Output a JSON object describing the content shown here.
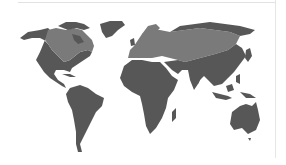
{
  "map": {
    "title": "World map",
    "projection": "equirectangular-like",
    "colors": {
      "background": "#ffffff",
      "land_default": "#575757",
      "land_highlight": "#7a7a7a",
      "frame_line": "#e2e2e2"
    },
    "regions": [
      {
        "name": "North America (south/west)",
        "shade": "land_default"
      },
      {
        "name": "Canada / northern North America band",
        "shade": "land_highlight"
      },
      {
        "name": "Greenland",
        "shade": "land_default"
      },
      {
        "name": "South America",
        "shade": "land_default"
      },
      {
        "name": "Europe / northern Eurasia band",
        "shade": "land_highlight"
      },
      {
        "name": "Arctic Russia",
        "shade": "land_default"
      },
      {
        "name": "Africa",
        "shade": "land_default"
      },
      {
        "name": "Southern and East Asia",
        "shade": "land_default"
      },
      {
        "name": "Southeast Asia / Indonesia",
        "shade": "land_default"
      },
      {
        "name": "Australia",
        "shade": "land_default"
      }
    ]
  }
}
